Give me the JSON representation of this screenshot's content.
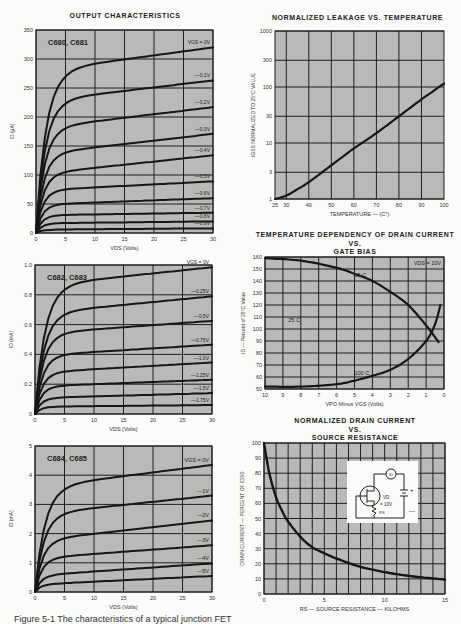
{
  "page": {
    "caption": "Figure 5-1 The characteristics of a typical junction FET"
  },
  "chart_data": [
    {
      "id": "c680",
      "type": "line",
      "title": "OUTPUT CHARACTERISTICS",
      "annotation": "C680, C681",
      "xlabel": "VDS (Volts)",
      "ylabel": "ID (μA)",
      "xlim": [
        0,
        30
      ],
      "ylim": [
        0,
        350
      ],
      "xticks": [
        0,
        5,
        10,
        15,
        20,
        25,
        30
      ],
      "yticks": [
        0,
        50,
        100,
        150,
        200,
        250,
        300,
        350
      ],
      "grid": true,
      "legend_title": "VGS = 0V",
      "series": [
        {
          "name": "0V",
          "knee": 285,
          "end": 320
        },
        {
          "name": "-0.1V",
          "knee": 232,
          "end": 263
        },
        {
          "name": "-0.2V",
          "knee": 185,
          "end": 217
        },
        {
          "name": "-0.3V",
          "knee": 140,
          "end": 171
        },
        {
          "name": "-0.4V",
          "knee": 105,
          "end": 134
        },
        {
          "name": "-0.5V",
          "knee": 75,
          "end": 89
        },
        {
          "name": "-0.6V",
          "knee": 50,
          "end": 60
        },
        {
          "name": "-0.7V",
          "knee": 31,
          "end": 35
        },
        {
          "name": "-0.8V",
          "knee": 17,
          "end": 20
        },
        {
          "name": "-0.9V",
          "knee": 6,
          "end": 8
        }
      ]
    },
    {
      "id": "leakage",
      "type": "line",
      "title": "NORMALIZED LEAKAGE VS. TEMPERATURE",
      "xlabel": "TEMPERATURE — (C°)",
      "ylabel": "IGSS NORMALIZED TO 25°C VALUE",
      "xlim": [
        25,
        100
      ],
      "ylim": [
        1,
        1000
      ],
      "yscale": "log",
      "xticks": [
        25,
        30,
        40,
        50,
        60,
        70,
        80,
        90,
        100
      ],
      "yticks": [
        1,
        3,
        10,
        30,
        100,
        300,
        1000
      ],
      "grid": true,
      "x": [
        25,
        30,
        35,
        40,
        50,
        60,
        70,
        80,
        90,
        100
      ],
      "values": [
        1,
        1.15,
        1.5,
        2.0,
        4.0,
        8.0,
        15,
        30,
        60,
        115
      ]
    },
    {
      "id": "c682",
      "type": "line",
      "annotation": "C682, C683",
      "xlabel": "VDS (Volts)",
      "ylabel": "ID (mA)",
      "xlim": [
        0,
        30
      ],
      "ylim": [
        0,
        1.0
      ],
      "xticks": [
        0,
        5,
        10,
        15,
        20,
        25,
        30
      ],
      "yticks": [
        0,
        0.2,
        0.4,
        0.6,
        0.8,
        1.0
      ],
      "grid": true,
      "legend_title": "VGS = 0V",
      "series": [
        {
          "name": "0V",
          "knee": 0.88,
          "end": 0.985
        },
        {
          "name": "-0.25V",
          "knee": 0.69,
          "end": 0.79
        },
        {
          "name": "-0.5V",
          "knee": 0.55,
          "end": 0.625
        },
        {
          "name": "-0.75V",
          "knee": 0.4,
          "end": 0.465
        },
        {
          "name": "-1.0V",
          "knee": 0.285,
          "end": 0.345
        },
        {
          "name": "-1.25V",
          "knee": 0.19,
          "end": 0.23
        },
        {
          "name": "-1.5V",
          "knee": 0.11,
          "end": 0.14
        },
        {
          "name": "-1.75V",
          "knee": 0.05,
          "end": 0.06
        }
      ]
    },
    {
      "id": "tempdep",
      "type": "line",
      "title": "TEMPERATURE DEPENDENCY OF DRAIN CURRENT VS. GATE BIAS",
      "title_lines": [
        "TEMPERATURE DEPENDENCY OF DRAIN CURRENT",
        "VS.",
        "GATE BIAS"
      ],
      "annotation": "VDS = 10V",
      "xlabel": "VPO Minus VGS (Volts)",
      "ylabel": "ID — Percent of 25°C Value",
      "xlim": [
        10,
        0
      ],
      "ylim": [
        50,
        160
      ],
      "xticks": [
        10,
        9,
        8,
        7,
        6,
        5,
        4,
        3,
        2,
        1,
        0
      ],
      "yticks": [
        50,
        60,
        70,
        80,
        90,
        100,
        110,
        120,
        130,
        140,
        150,
        160
      ],
      "grid": true,
      "series": [
        {
          "name": "-55 C",
          "x": [
            10,
            8,
            6,
            5,
            4,
            3,
            2,
            1,
            0.3
          ],
          "values": [
            159,
            157,
            151,
            146,
            140,
            131,
            120,
            103,
            89
          ]
        },
        {
          "name": "25 C",
          "x": [
            10,
            0
          ],
          "values": [
            100,
            100
          ]
        },
        {
          "name": "100 C",
          "x": [
            10,
            8,
            6,
            5,
            4,
            3,
            2,
            1,
            0.5,
            0.2
          ],
          "values": [
            52,
            52,
            54,
            57,
            61,
            66,
            75,
            90,
            104,
            120
          ]
        }
      ]
    },
    {
      "id": "c684",
      "type": "line",
      "annotation": "C684, C685",
      "xlabel": "VDS (Volts)",
      "ylabel": "ID (mA)",
      "xlim": [
        0,
        30
      ],
      "ylim": [
        0,
        5
      ],
      "xticks": [
        0,
        5,
        10,
        15,
        20,
        25,
        30
      ],
      "yticks": [
        0,
        1,
        2,
        3,
        4,
        5
      ],
      "grid": true,
      "legend_title": "VGS = 0V",
      "series": [
        {
          "name": "0V",
          "knee": 3.7,
          "end": 4.35
        },
        {
          "name": "-1V",
          "knee": 2.75,
          "end": 3.3
        },
        {
          "name": "-2V",
          "knee": 1.85,
          "end": 2.45
        },
        {
          "name": "-3V",
          "knee": 1.2,
          "end": 1.6
        },
        {
          "name": "-4V",
          "knee": 0.6,
          "end": 0.98
        },
        {
          "name": "-5V",
          "knee": 0.28,
          "end": 0.55
        }
      ]
    },
    {
      "id": "srcres",
      "type": "line",
      "title": "NORMALIZED DRAIN CURRENT VS. SOURCE RESISTANCE",
      "title_lines": [
        "NORMALIZED DRAIN CURRENT",
        "VS.",
        "SOURCE RESISTANCE"
      ],
      "xlabel": "RS — SOURCE RESISTANCE — KILOHMS",
      "ylabel": "DRAIN CURRENT — PERCENT OF IDSS",
      "xlim": [
        0,
        15
      ],
      "ylim": [
        0,
        100
      ],
      "xticks": [
        0,
        5,
        10,
        15
      ],
      "yticks": [
        0,
        10,
        20,
        30,
        40,
        50,
        60,
        70,
        80,
        90,
        100
      ],
      "grid": true,
      "inset": {
        "label_vd": "VD",
        "label_v": "= 10V",
        "label_rs": "RS",
        "label_id": "ID",
        "plus": "+",
        "minus": "—"
      },
      "x": [
        0,
        0.25,
        0.5,
        1,
        1.5,
        2,
        3,
        4,
        5,
        6,
        8,
        10,
        12,
        15
      ],
      "values": [
        100,
        88,
        78,
        64,
        55,
        48,
        38,
        31,
        27,
        23.5,
        18,
        14.5,
        12,
        9.5
      ]
    }
  ]
}
